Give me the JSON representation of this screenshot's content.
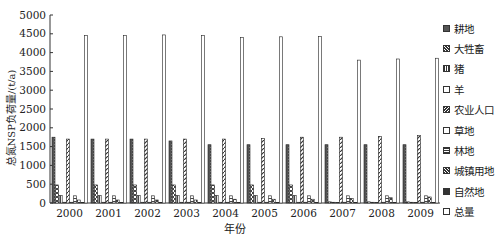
{
  "chart_data": {
    "type": "bar",
    "title": "",
    "xlabel": "年份",
    "ylabel": "总氮NSP负荷量/(t/a)",
    "ylim": [
      0,
      5000
    ],
    "yticks": [
      0,
      500,
      1000,
      1500,
      2000,
      2500,
      3000,
      3500,
      4000,
      4500,
      5000
    ],
    "grid": false,
    "legend_position": "right",
    "categories": [
      "2000",
      "2001",
      "2002",
      "2003",
      "2004",
      "2005",
      "2006",
      "2007",
      "2008",
      "2009"
    ],
    "series": [
      {
        "name": "耕地",
        "values": [
          1750,
          1700,
          1700,
          1650,
          1550,
          1550,
          1550,
          1550,
          1550,
          1550
        ]
      },
      {
        "name": "大牲畜",
        "values": [
          480,
          480,
          480,
          480,
          480,
          480,
          480,
          30,
          30,
          30
        ]
      },
      {
        "name": "猪",
        "values": [
          200,
          200,
          200,
          200,
          200,
          200,
          200,
          20,
          20,
          20
        ]
      },
      {
        "name": "羊",
        "values": [
          20,
          20,
          20,
          20,
          20,
          20,
          20,
          10,
          10,
          10
        ]
      },
      {
        "name": "农业人口",
        "values": [
          1700,
          1700,
          1700,
          1700,
          1700,
          1720,
          1750,
          1750,
          1770,
          1800
        ]
      },
      {
        "name": "草地",
        "values": [
          20,
          20,
          20,
          20,
          20,
          20,
          20,
          20,
          20,
          20
        ]
      },
      {
        "name": "林地",
        "values": [
          190,
          190,
          190,
          190,
          190,
          190,
          190,
          190,
          190,
          190
        ]
      },
      {
        "name": "城镇用地",
        "values": [
          80,
          80,
          80,
          80,
          100,
          100,
          100,
          120,
          140,
          160
        ]
      },
      {
        "name": "自然地",
        "values": [
          10,
          10,
          10,
          10,
          10,
          10,
          10,
          10,
          10,
          10
        ]
      },
      {
        "name": "总量",
        "values": [
          4450,
          4450,
          4470,
          4450,
          4400,
          4420,
          4430,
          3800,
          3830,
          3850
        ]
      }
    ]
  },
  "legend": [
    {
      "label": "耕地"
    },
    {
      "label": "大牲畜"
    },
    {
      "label": "猪"
    },
    {
      "label": "羊"
    },
    {
      "label": "农业人口"
    },
    {
      "label": "草地"
    },
    {
      "label": "林地"
    },
    {
      "label": "城镇用地"
    },
    {
      "label": "自然地"
    },
    {
      "label": "总量"
    }
  ]
}
